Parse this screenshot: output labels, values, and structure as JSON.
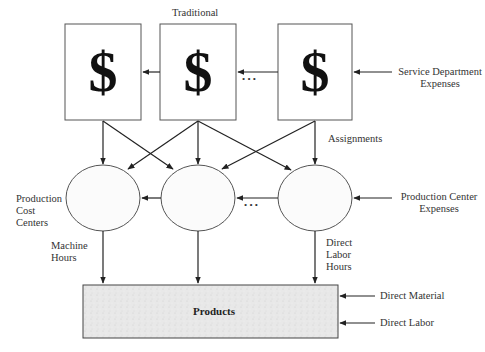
{
  "diagram": {
    "title": "Traditional",
    "service_departments": [
      {
        "symbol": "$"
      },
      {
        "symbol": "$"
      },
      {
        "symbol": "$"
      }
    ],
    "ellipsis": "• • •",
    "labels": {
      "service_department_expenses": [
        "Service Department",
        "Expenses"
      ],
      "assignments": "Assignments",
      "production_cost_centers": [
        "Production",
        "Cost",
        "Centers"
      ],
      "production_center_expenses": [
        "Production Center",
        "Expenses"
      ],
      "machine_hours": [
        "Machine",
        "Hours"
      ],
      "direct_labor_hours": [
        "Direct",
        "Labor",
        "Hours"
      ],
      "products": "Products",
      "direct_material": "Direct Material",
      "direct_labor": "Direct Labor"
    },
    "colors": {
      "line": "#222222",
      "box_border": "#555555",
      "products_fill": "#e6e6e6"
    }
  }
}
